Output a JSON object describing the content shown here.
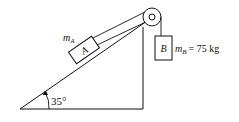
{
  "diagram": {
    "type": "physics-incline-pulley",
    "incline_angle_label": "35°",
    "block_a": {
      "letter": "A",
      "mass_symbol": "m",
      "mass_subscript": "A"
    },
    "block_b": {
      "letter": "B",
      "mass_symbol": "m",
      "mass_subscript": "B",
      "mass_value": "= 75 kg"
    },
    "colors": {
      "stroke": "#111111",
      "background": "#ffffff"
    }
  }
}
